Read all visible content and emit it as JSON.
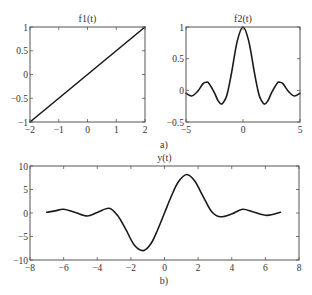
{
  "figure_labels": {
    "a": "a)",
    "b": "b)"
  },
  "chart_data": [
    {
      "type": "line",
      "title": "f1(t)",
      "xlabel": "",
      "ylabel": "",
      "xlim": [
        -2,
        2
      ],
      "ylim": [
        -1,
        1
      ],
      "xticks": [
        -2,
        -1,
        0,
        1,
        2
      ],
      "xtick_labels": [
        "−2",
        "−1",
        "0",
        "1",
        "2"
      ],
      "yticks": [
        -1,
        -0.5,
        0,
        0.5,
        1
      ],
      "ytick_labels": [
        "−1",
        "−0.5",
        "0",
        "0.5",
        "1"
      ],
      "grid": false,
      "series": [
        {
          "name": "f1(t)",
          "x": [
            -2,
            2
          ],
          "y": [
            -1,
            1
          ]
        }
      ]
    },
    {
      "type": "line",
      "title": "f2(t)",
      "xlabel": "",
      "ylabel": "",
      "xlim": [
        -5,
        5
      ],
      "ylim": [
        -0.5,
        1
      ],
      "xticks": [
        -5,
        0,
        5
      ],
      "xtick_labels": [
        "−5",
        "0",
        "5"
      ],
      "yticks": [
        -0.5,
        0,
        0.5,
        1
      ],
      "ytick_labels": [
        "−0.5",
        "0",
        "0.5",
        "1"
      ],
      "grid": false,
      "series": [
        {
          "name": "f2(t)",
          "x": [
            -5,
            -4.5,
            -4,
            -3.5,
            -3.2,
            -3,
            -2.5,
            -2.2,
            -1.87,
            -1.5,
            -1.31,
            -1,
            -0.5,
            0,
            0.5,
            1,
            1.31,
            1.5,
            1.87,
            2.2,
            2.5,
            3,
            3.2,
            3.5,
            4,
            4.5,
            5
          ],
          "y": [
            -0.045,
            -0.09,
            -0.02,
            0.105,
            0.128,
            0.112,
            -0.04,
            -0.16,
            -0.217,
            -0.12,
            0,
            0.28,
            0.78,
            1,
            0.78,
            0.28,
            0,
            -0.12,
            -0.217,
            -0.16,
            -0.04,
            0.112,
            0.128,
            0.105,
            -0.02,
            -0.09,
            -0.045
          ]
        }
      ]
    },
    {
      "type": "line",
      "title": "y(t)",
      "xlabel": "",
      "ylabel": "",
      "xlim": [
        -8,
        8
      ],
      "ylim": [
        -10,
        10
      ],
      "xticks": [
        -8,
        -6,
        -4,
        -2,
        0,
        2,
        4,
        6,
        8
      ],
      "xtick_labels": [
        "−8",
        "−6",
        "−4",
        "−2",
        "0",
        "2",
        "4",
        "6",
        "8"
      ],
      "yticks": [
        -10,
        -5,
        0,
        5,
        10
      ],
      "ytick_labels": [
        "−10",
        "−5",
        "0",
        "5",
        "10"
      ],
      "grid": false,
      "series": [
        {
          "name": "y(t)",
          "x": [
            -7,
            -6.5,
            -6,
            -5.3,
            -4.6,
            -4,
            -3.3,
            -2.8,
            -2.3,
            -1.8,
            -1.26,
            -0.8,
            -0.4,
            0,
            0.4,
            0.8,
            1.32,
            1.8,
            2.3,
            2.8,
            3.3,
            4,
            4.65,
            5.3,
            6.1,
            6.9
          ],
          "y": [
            0.15,
            0.45,
            0.8,
            0.1,
            -0.65,
            0.1,
            1.0,
            -0.5,
            -3.5,
            -6.8,
            -8.0,
            -6.5,
            -3.5,
            0,
            3.5,
            6.5,
            8.2,
            6.8,
            3.5,
            0.3,
            -0.8,
            -0.2,
            0.8,
            0.2,
            -0.5,
            0.15
          ]
        }
      ]
    }
  ]
}
